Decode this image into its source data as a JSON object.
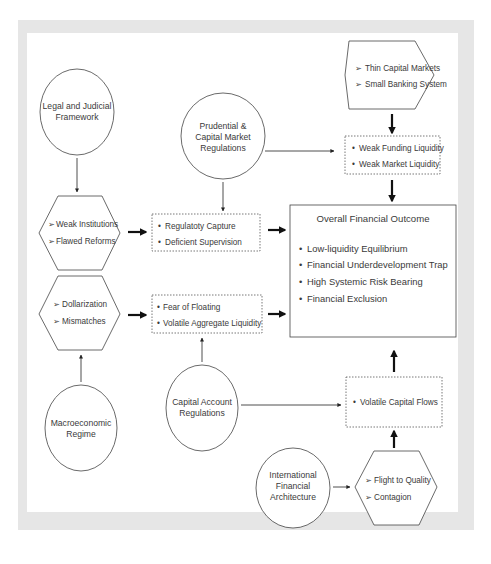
{
  "diagram": {
    "circles": {
      "legal": [
        "Legal and Judicial",
        "Framework"
      ],
      "prudential": [
        "Prudential &",
        "Capital Market",
        "Regulations"
      ],
      "macro": [
        "Macroeconomic",
        "Regime"
      ],
      "capital_account": [
        "Capital Account",
        "Regulations"
      ],
      "international": [
        "International",
        "Financial",
        "Architecture"
      ]
    },
    "hexagons": {
      "thin_markets": [
        "Thin Capital Markets",
        "Small Banking System"
      ],
      "institutions": [
        "Weak Institutions",
        "Flawed Reforms"
      ],
      "dollarization": [
        "Dollarization",
        "Mismatches"
      ],
      "flight": [
        "Flight to Quality",
        "Contagion"
      ]
    },
    "boxes": {
      "liquidity": [
        "Weak Funding Liquidity",
        "Weak Market Liquidity"
      ],
      "regulatory": [
        "Regulatoty Capture",
        "Deficient Supervision"
      ],
      "floating": [
        "Fear of Floating",
        "Volatile Aggregate Liquidity"
      ],
      "capital_flows": [
        "Volatile Capital Flows"
      ]
    },
    "outcome": {
      "title": "Overall Financial Outcome",
      "items": [
        "Low-liquidity Equilibrium",
        "Financial Underdevelopment Trap",
        "High Systemic Risk Bearing",
        "Financial Exclusion"
      ]
    },
    "hex_bullet": "➢",
    "box_bullet": "•"
  }
}
